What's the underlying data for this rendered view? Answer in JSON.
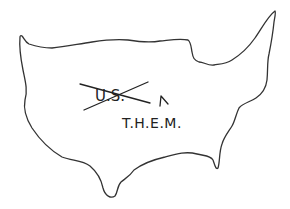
{
  "drawing": {
    "subject": "hand-drawn outline of the United States",
    "crossed_out_text": "U.S.",
    "insertion_mark": "^",
    "replacement_text": "T.H.E.M.",
    "colors": {
      "background": "#ffffff",
      "ink": "#222222"
    }
  }
}
